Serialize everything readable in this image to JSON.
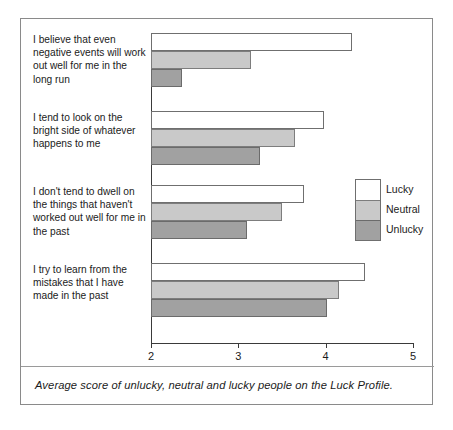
{
  "figure": {
    "caption": "Average score of unlucky, neutral and lucky people on the Luck Profile."
  },
  "legend": {
    "entries": [
      {
        "label": "Lucky",
        "color": "#ffffff",
        "key": "lucky"
      },
      {
        "label": "Neutral",
        "color": "#c9c9c9",
        "key": "neutral"
      },
      {
        "label": "Unlucky",
        "color": "#a1a1a1",
        "key": "unlucky"
      }
    ]
  },
  "axis": {
    "ticks": [
      "2",
      "3",
      "4",
      "5"
    ],
    "min": 2,
    "max": 5
  },
  "chart_data": {
    "type": "bar",
    "orientation": "horizontal",
    "title": "",
    "subtitle": "",
    "xlabel": "",
    "ylabel": "",
    "xlim": [
      2,
      5
    ],
    "xticks": [
      2,
      3,
      4,
      5
    ],
    "grid": false,
    "legend_position": "right",
    "categories": [
      "I believe that even negative events will work out well for me in the long run",
      "I tend to look on the bright side of whatever happens to me",
      "I don't tend to dwell on the things that haven't worked out well for me in the past",
      "I try to learn from the mistakes that I have made in the past"
    ],
    "series": [
      {
        "name": "Lucky",
        "color": "#ffffff",
        "values": [
          4.3,
          3.98,
          3.75,
          4.45
        ]
      },
      {
        "name": "Neutral",
        "color": "#c9c9c9",
        "values": [
          3.15,
          3.65,
          3.5,
          4.15
        ]
      },
      {
        "name": "Unlucky",
        "color": "#a1a1a1",
        "values": [
          2.36,
          3.25,
          3.1,
          4.02
        ]
      }
    ],
    "annotation": "Average score of unlucky, neutral and lucky people on the Luck Profile."
  }
}
